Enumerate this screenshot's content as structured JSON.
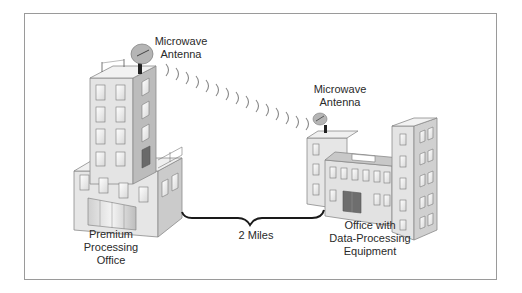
{
  "diagram": {
    "labels": {
      "antenna_left": [
        "Microwave",
        "Antenna"
      ],
      "antenna_right": [
        "Microwave",
        "Antenna"
      ],
      "building_left": [
        "Premium",
        "Processing",
        "Office"
      ],
      "building_right": [
        "Office with",
        "Data-Processing",
        "Equipment"
      ],
      "distance": "2 Miles"
    },
    "elements": {
      "left_building": "premium-processing-office",
      "right_building": "office-with-data-processing-equipment",
      "link": "microwave-signal-arcs",
      "brace": "distance-brace"
    },
    "colors": {
      "frame_border": "#9a9a9a",
      "building_front": "#e4e4e4",
      "building_side": "#bdbdbd",
      "building_top": "#efefef",
      "window": "#f6f6f6",
      "door_dark": "#6e6e6e",
      "text": "#2a2a2a"
    }
  }
}
